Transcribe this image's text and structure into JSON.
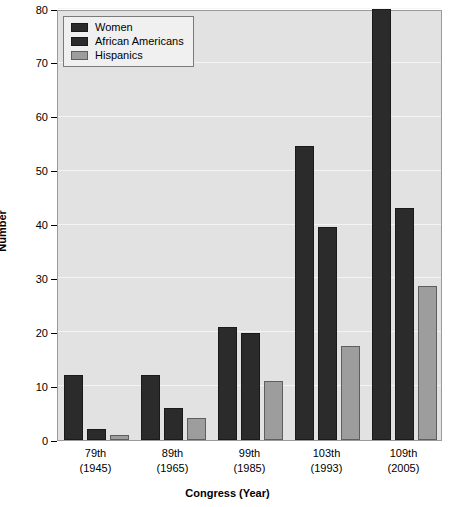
{
  "chart_data": {
    "type": "bar",
    "title": "",
    "xlabel": "Congress (Year)",
    "ylabel": "Number",
    "ylim": [
      0,
      80
    ],
    "yticks": [
      0,
      10,
      20,
      30,
      40,
      50,
      60,
      70,
      80
    ],
    "grid": true,
    "legend_position": "top-left",
    "categories": [
      "79th\n(1945)",
      "89th\n(1965)",
      "99th\n(1985)",
      "103th\n(1993)",
      "109th\n(2005)"
    ],
    "category_lines": [
      {
        "line1": "79th",
        "line2": "(1945)"
      },
      {
        "line1": "89th",
        "line2": "(1965)"
      },
      {
        "line1": "99th",
        "line2": "(1985)"
      },
      {
        "line1": "103th",
        "line2": "(1993)"
      },
      {
        "line1": "109th",
        "line2": "(2005)"
      }
    ],
    "series": [
      {
        "name": "Women",
        "color": "#2b2b2b",
        "values": [
          12,
          12,
          21,
          54.5,
          80
        ]
      },
      {
        "name": "African Americans",
        "color": "#2b2b2b",
        "values": [
          2,
          6,
          19.8,
          39.5,
          43
        ]
      },
      {
        "name": "Hispanics",
        "color": "#9d9d9d",
        "values": [
          1,
          4,
          11,
          17.5,
          28.5
        ]
      }
    ]
  },
  "colors": {
    "plot_background": "#e2e2e2",
    "gridline": "#f4f4f4",
    "dark_series": "#2b2b2b",
    "light_series": "#9d9d9d",
    "axis": "#000000"
  }
}
